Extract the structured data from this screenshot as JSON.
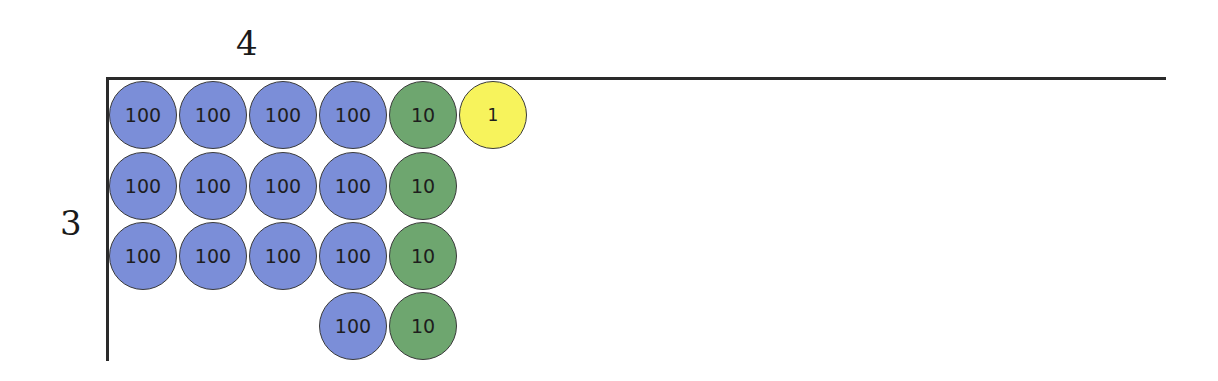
{
  "diagram": {
    "top_label": "4",
    "side_label": "3",
    "colors": {
      "hundred": "#7b8ed8",
      "ten": "#6ea66f",
      "one": "#f7f35c",
      "line": "#2a2a2a"
    },
    "rows": [
      {
        "chips": [
          {
            "value": "100",
            "type": "hundred",
            "col": 0
          },
          {
            "value": "100",
            "type": "hundred",
            "col": 1
          },
          {
            "value": "100",
            "type": "hundred",
            "col": 2
          },
          {
            "value": "100",
            "type": "hundred",
            "col": 3
          },
          {
            "value": "10",
            "type": "ten",
            "col": 4
          },
          {
            "value": "1",
            "type": "one",
            "col": 5
          }
        ]
      },
      {
        "chips": [
          {
            "value": "100",
            "type": "hundred",
            "col": 0
          },
          {
            "value": "100",
            "type": "hundred",
            "col": 1
          },
          {
            "value": "100",
            "type": "hundred",
            "col": 2
          },
          {
            "value": "100",
            "type": "hundred",
            "col": 3
          },
          {
            "value": "10",
            "type": "ten",
            "col": 4
          }
        ]
      },
      {
        "chips": [
          {
            "value": "100",
            "type": "hundred",
            "col": 0
          },
          {
            "value": "100",
            "type": "hundred",
            "col": 1
          },
          {
            "value": "100",
            "type": "hundred",
            "col": 2
          },
          {
            "value": "100",
            "type": "hundred",
            "col": 3
          },
          {
            "value": "10",
            "type": "ten",
            "col": 4
          }
        ]
      },
      {
        "chips": [
          {
            "value": "100",
            "type": "hundred",
            "col": 3
          },
          {
            "value": "10",
            "type": "ten",
            "col": 4
          }
        ]
      }
    ]
  }
}
